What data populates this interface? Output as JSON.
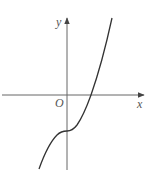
{
  "diagram": {
    "type": "function-graph",
    "axes": {
      "x_label": "x",
      "y_label": "y",
      "origin_label": "O"
    },
    "colors": {
      "axis": "#666666",
      "curve": "#333333",
      "label": "#555555"
    }
  }
}
